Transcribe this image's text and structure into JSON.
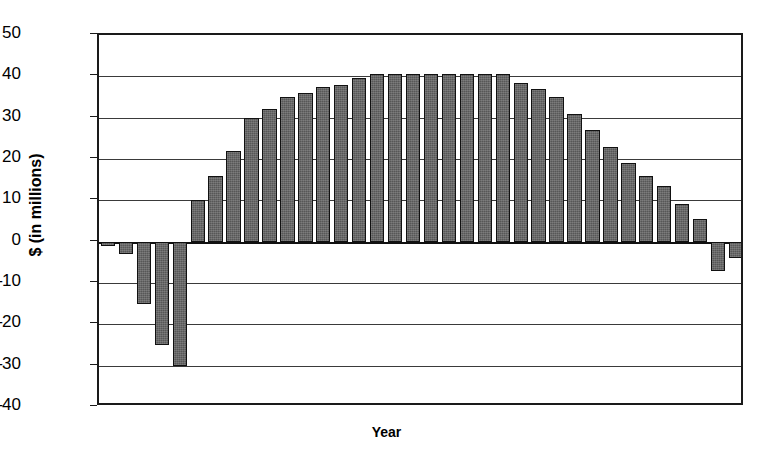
{
  "chart_data": {
    "type": "bar",
    "title": "",
    "xlabel": "Year",
    "ylabel": "$ (in millions)",
    "ylim": [
      -40,
      50
    ],
    "ytick_labels": [
      "50",
      "40",
      "30",
      "20",
      "10",
      "0",
      "–10",
      "–20",
      "–30",
      "–40"
    ],
    "ytick_values": [
      50,
      40,
      30,
      20,
      10,
      0,
      -10,
      -20,
      -30,
      -40
    ],
    "grid": "horizontal",
    "legend": "none",
    "xtick_labels": [],
    "bar_color": "#575757",
    "bar_edge_color": "#111111",
    "frame_color": "#1a1a1a",
    "n_bars": 36,
    "categories": [
      "1",
      "2",
      "3",
      "4",
      "5",
      "6",
      "7",
      "8",
      "9",
      "10",
      "11",
      "12",
      "13",
      "14",
      "15",
      "16",
      "17",
      "18",
      "19",
      "20",
      "21",
      "22",
      "23",
      "24",
      "25",
      "26",
      "27",
      "28",
      "29",
      "30",
      "31",
      "32",
      "33",
      "34",
      "35",
      "36"
    ],
    "values": [
      -1,
      -3,
      -15,
      -25,
      -30,
      10,
      16,
      22,
      30,
      32,
      35,
      36,
      37.5,
      38,
      39.5,
      40.5,
      40.5,
      40.5,
      40.5,
      40.5,
      40.5,
      40.5,
      40.5,
      38.5,
      37,
      35,
      31,
      27,
      23,
      19,
      16,
      13.5,
      9,
      5.5,
      -7,
      -4
    ]
  },
  "axis": {
    "x_axis_label": "Year",
    "y_axis_label": "$ (in millions)"
  }
}
